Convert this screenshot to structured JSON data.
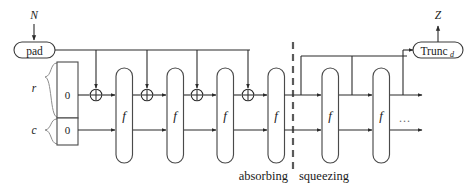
{
  "diagram": {
    "inputs": {
      "message_label": "N",
      "output_label": "Z"
    },
    "blocks": {
      "pad_label": "pad",
      "trunc_label": "Trunc",
      "trunc_subscript": "d",
      "permutation_label": "f"
    },
    "state": {
      "rate_label": "r",
      "capacity_label": "c",
      "rate_init_value": "0",
      "capacity_init_value": "0"
    },
    "phases": {
      "absorbing_label": "absorbing",
      "squeezing_label": "squeezing",
      "continuation_label": "..."
    },
    "operators": {
      "xor_label": "xor-icon"
    },
    "permutations": [
      {
        "label": "f",
        "phase": "absorbing"
      },
      {
        "label": "f",
        "phase": "absorbing"
      },
      {
        "label": "f",
        "phase": "absorbing"
      },
      {
        "label": "f",
        "phase": "absorbing"
      },
      {
        "label": "f",
        "phase": "squeezing"
      },
      {
        "label": "f",
        "phase": "squeezing"
      }
    ],
    "xor_gates": [
      {
        "label": "+"
      },
      {
        "label": "+"
      },
      {
        "label": "+"
      },
      {
        "label": "+"
      }
    ],
    "colors": {
      "line": "#2b2b2b",
      "block_stroke": "#4a4a4a",
      "brace": "#8d8d8d",
      "divider": "#5a5a5a",
      "background": "#ffffff",
      "text": "#1a1a1a"
    }
  }
}
